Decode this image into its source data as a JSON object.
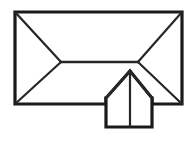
{
  "figure": {
    "type": "line-drawing",
    "canvas": {
      "width": 194,
      "height": 149,
      "background": "#ffffff"
    },
    "colors": {
      "outline_stroke": "#1a1a1a",
      "interior_stroke": "#262626",
      "fill": "#ffffff"
    },
    "stroke_widths": {
      "outline": 3.2,
      "hip": 2.2,
      "ridge": 2.4
    }
  },
  "geometry": {
    "main_roof": {
      "label": "main hip roof rectangle",
      "corners": {
        "top_left": [
          15,
          12
        ],
        "top_right": [
          182,
          12
        ],
        "bottom_right": [
          182,
          104
        ],
        "bottom_left": [
          15,
          104
        ]
      },
      "perimeter_path": "M 15 12 L 182 12 L 182 104 L 152 104 L 152 98 L 106 98 L 106 104 L 15 104 Z",
      "gap_in_bottom_edge": {
        "from_x": 106,
        "to_x": 152,
        "reason": "gable projection intersects eave"
      }
    },
    "ridge": {
      "label": "main ridge line",
      "start": [
        61,
        62
      ],
      "end": [
        138,
        62
      ],
      "path": "M 61 62 L 138 62"
    },
    "hips": [
      {
        "name": "hip-top-left",
        "path": "M 15 12 L 61 62"
      },
      {
        "name": "hip-bottom-left",
        "path": "M 15 104 L 61 62"
      },
      {
        "name": "hip-top-right",
        "path": "M 182 12 L 138 62"
      },
      {
        "name": "hip-bottom-right",
        "path": "M 182 104 L 138 62"
      }
    ],
    "gable_projection": {
      "label": "front gable dormer",
      "apex": [
        130,
        71
      ],
      "eave_left": [
        106,
        98
      ],
      "eave_right": [
        152,
        98
      ],
      "base_left": [
        106,
        127
      ],
      "base_right": [
        152,
        127
      ],
      "outline_path": "M 106 98 L 130 71 L 152 98 L 152 127 L 106 127 Z",
      "left_slope_path": "M 106 98 L 130 71",
      "right_slope_path": "M 130 71 L 152 98",
      "center_ridge_path": "M 130 71 L 130 127"
    }
  }
}
